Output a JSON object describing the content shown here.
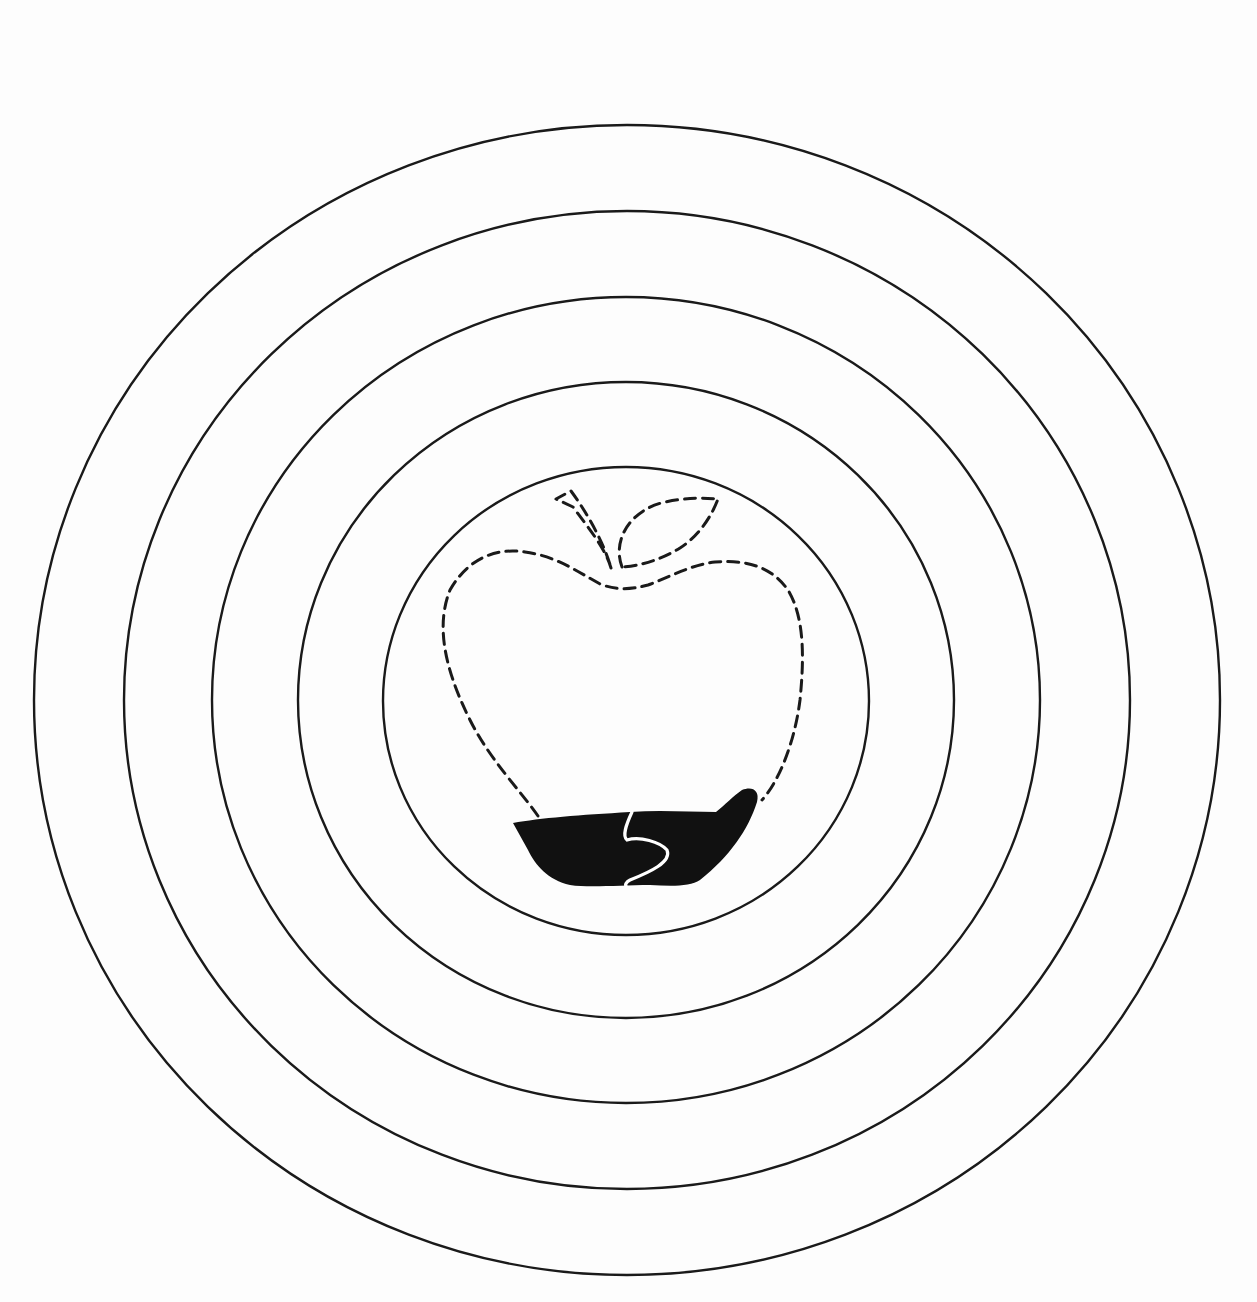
{
  "illustration": {
    "description": "Concentric rings around a dashed apple outline with partially filled base",
    "colors": {
      "background": "#fdfdfd",
      "line": "#1a1a1a",
      "fill": "#111111",
      "divider": "#ffffff"
    },
    "rings": [
      {
        "cx": 627,
        "cy": 700,
        "rx": 593,
        "ry": 575
      },
      {
        "cx": 627,
        "cy": 700,
        "rx": 503,
        "ry": 489
      },
      {
        "cx": 626,
        "cy": 700,
        "rx": 414,
        "ry": 403
      },
      {
        "cx": 626,
        "cy": 700,
        "rx": 328,
        "ry": 318
      },
      {
        "cx": 626,
        "cy": 701,
        "rx": 243,
        "ry": 234
      }
    ],
    "apple": {
      "outline_style": "dashed",
      "filled_portion": "bottom",
      "parts": [
        "stem",
        "leaf",
        "body",
        "filled-base"
      ]
    }
  }
}
